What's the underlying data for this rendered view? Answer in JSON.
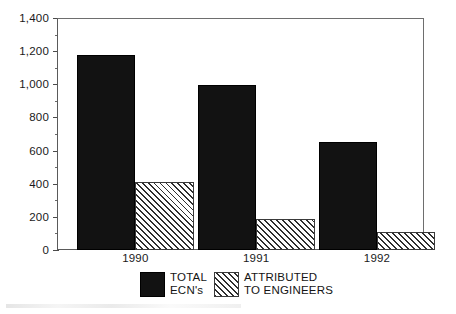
{
  "chart_data": {
    "type": "bar",
    "title": "",
    "subtitle": "",
    "xlabel": "",
    "ylabel": "",
    "categories": [
      "1990",
      "1991",
      "1992"
    ],
    "series": [
      {
        "name": "TOTAL ECN's",
        "values": [
          1180,
          1000,
          655
        ],
        "style": "solid-black"
      },
      {
        "name": "ATTRIBUTED TO ENGINEERS",
        "values": [
          410,
          185,
          110
        ],
        "style": "diagonal-hatch"
      }
    ],
    "ylim": [
      0,
      1400
    ],
    "y_major_ticks": [
      0,
      200,
      400,
      600,
      800,
      1000,
      1200,
      1400
    ],
    "y_tick_labels": [
      "0",
      "200",
      "400",
      "600",
      "800",
      "1,000",
      "1,200",
      "1,400"
    ],
    "y_minor_tick_interval": 100,
    "grid": false,
    "legend_position": "bottom-center",
    "frame": true
  },
  "legend": {
    "entries": [
      {
        "label_line1": "TOTAL",
        "label_line2": "ECN's",
        "swatch": "solid-black-swatch"
      },
      {
        "label_line1": "ATTRIBUTED",
        "label_line2": "TO ENGINEERS",
        "swatch": "hatched-swatch"
      }
    ]
  },
  "colors": {
    "series_total": "#121212",
    "series_attributed_hatch": "#2f2f2f",
    "frame": "#5a5a5a",
    "text": "#1a1a1a",
    "background": "#ffffff"
  }
}
